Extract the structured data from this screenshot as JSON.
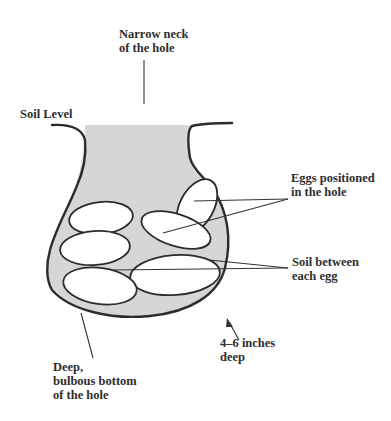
{
  "diagram": {
    "colors": {
      "soil_fill": "#d6d6d6",
      "outline": "#2b2b2b",
      "egg_fill": "#ffffff",
      "background": "#ffffff"
    },
    "labels": {
      "neck_line1": "Narrow neck",
      "neck_line2": "of the hole",
      "soil_level": "Soil Level",
      "eggs_line1": "Eggs positioned",
      "eggs_line2": "in the hole",
      "soil_between_line1": "Soil between",
      "soil_between_line2": "each egg",
      "depth_line1": "4–6 inches",
      "depth_line2": "deep",
      "bottom_line1": "Deep,",
      "bottom_line2": "bulbous bottom",
      "bottom_line3": "of the hole"
    },
    "egg_count": 5
  }
}
